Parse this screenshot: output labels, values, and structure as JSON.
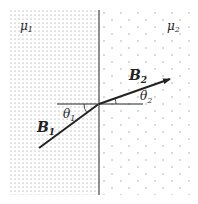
{
  "diagram": {
    "regions": [
      {
        "name": "medium-1",
        "label": "μ",
        "subscript": "1",
        "pattern": "dense-dots"
      },
      {
        "name": "medium-2",
        "label": "μ",
        "subscript": "2",
        "pattern": "sparse-dots"
      }
    ],
    "vectors": [
      {
        "name": "B1",
        "label": "B",
        "subscript": "1"
      },
      {
        "name": "B2",
        "label": "B",
        "subscript": "2"
      }
    ],
    "angles": [
      {
        "name": "theta1",
        "label": "θ",
        "subscript": "1"
      },
      {
        "name": "theta2",
        "label": "θ",
        "subscript": "2"
      }
    ],
    "colors": {
      "line": "#222222",
      "dots": "#8a8a8a",
      "boundary": "#555555"
    }
  }
}
